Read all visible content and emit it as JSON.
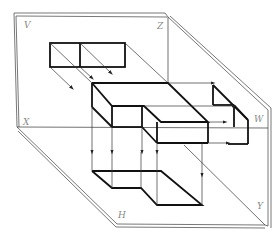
{
  "diagram": {
    "planes": {
      "V": "V",
      "H": "H",
      "W": "W"
    },
    "axes": {
      "X": "X",
      "Y": "Y",
      "Z": "Z"
    },
    "colors": {
      "outline": "#111111",
      "projection_lines": "#333333",
      "plane_edges": "#555555",
      "labels": "#8a8a8a"
    }
  }
}
